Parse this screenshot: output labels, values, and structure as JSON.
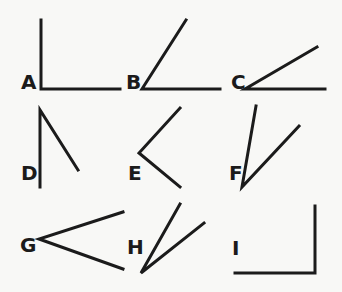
{
  "diagram": {
    "line_color": "#1b1b1b",
    "background": "#f8f8f6",
    "angles": [
      {
        "label": "A",
        "label_pos": [
          21,
          89
        ],
        "vertex": [
          41,
          89
        ],
        "ends": [
          [
            41,
            20
          ],
          [
            120,
            89
          ]
        ]
      },
      {
        "label": "B",
        "label_pos": [
          126,
          89
        ],
        "vertex": [
          142,
          89
        ],
        "ends": [
          [
            186,
            20
          ],
          [
            220,
            89
          ]
        ]
      },
      {
        "label": "C",
        "label_pos": [
          231,
          89
        ],
        "vertex": [
          245,
          89
        ],
        "ends": [
          [
            317,
            47
          ],
          [
            325,
            89
          ]
        ]
      },
      {
        "label": "D",
        "label_pos": [
          21,
          180
        ],
        "vertex": [
          40,
          110
        ],
        "ends": [
          [
            40,
            187
          ],
          [
            78,
            170
          ]
        ]
      },
      {
        "label": "E",
        "label_pos": [
          128,
          180
        ],
        "vertex": [
          139,
          153
        ],
        "ends": [
          [
            180,
            108
          ],
          [
            180,
            187
          ]
        ]
      },
      {
        "label": "F",
        "label_pos": [
          229,
          180
        ],
        "vertex": [
          242,
          187
        ],
        "ends": [
          [
            256,
            106
          ],
          [
            299,
            126
          ]
        ]
      },
      {
        "label": "G",
        "label_pos": [
          20,
          252
        ],
        "vertex": [
          39,
          239
        ],
        "ends": [
          [
            123,
            212
          ],
          [
            123,
            269
          ]
        ]
      },
      {
        "label": "H",
        "label_pos": [
          127,
          254
        ],
        "vertex": [
          141,
          273
        ],
        "ends": [
          [
            180,
            204
          ],
          [
            204,
            223
          ]
        ]
      },
      {
        "label": "I",
        "label_pos": [
          232,
          255
        ],
        "vertex": [
          315,
          273
        ],
        "ends": [
          [
            315,
            206
          ],
          [
            235,
            273
          ]
        ]
      }
    ]
  }
}
